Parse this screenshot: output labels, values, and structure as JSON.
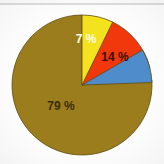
{
  "chart_data": {
    "type": "pie",
    "title": "",
    "subtitle": "",
    "xlabel": "",
    "ylabel": "",
    "legend": "none",
    "grid": false,
    "categories": [
      "Olive",
      "Red",
      "Blue",
      "Yellow"
    ],
    "values": [
      79,
      14,
      0,
      7
    ],
    "labels": [
      "79 %",
      "14 %",
      "",
      "7 %"
    ],
    "colors": [
      "#9c7d1d",
      "#f0380c",
      "#4e8ccb",
      "#f4e21f"
    ],
    "slices": [
      {
        "name": "olive-slice",
        "label": "79 %",
        "value": 79,
        "color": "#9c7d1d",
        "label_color": "#3a2f07",
        "start_angle": 86,
        "end_angle": 360,
        "label_x": 61,
        "label_y": 110,
        "font_size": 12
      },
      {
        "name": "red-slice",
        "label": "14 %",
        "value": 14,
        "color": "#f0380c",
        "label_color": "#401004",
        "start_angle": 25,
        "end_angle": 76,
        "label_x": 115,
        "label_y": 61,
        "font_size": 12
      },
      {
        "name": "blue-slice",
        "label": "",
        "value": 0,
        "color": "#4e8ccb",
        "label_color": "#0d2c4c",
        "start_angle": 60,
        "end_angle": 88,
        "label_x": 96,
        "label_y": 74,
        "font_size": 10
      },
      {
        "name": "yellow-slice",
        "label": "7 %",
        "value": 7,
        "color": "#f4e21f",
        "label_color": "#fdfbe8",
        "start_angle": 0,
        "end_angle": 26,
        "label_x": 86,
        "label_y": 43,
        "font_size": 12
      }
    ],
    "geometry": {
      "center_x": 82,
      "center_y": 85,
      "radius": 70,
      "stroke_color": "#5f4b10",
      "stroke_width": 0.8
    }
  }
}
